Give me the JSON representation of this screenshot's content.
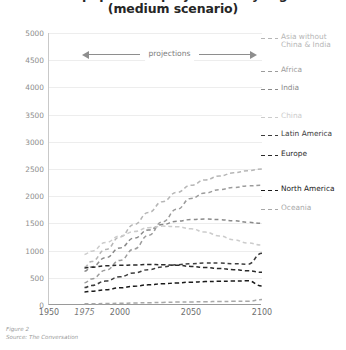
{
  "title": {
    "line1": "World population projections by region",
    "line2": "(medium scenario)"
  },
  "annotation": {
    "projections_label": "projections"
  },
  "footer": {
    "figure": "Figure 2",
    "source": "Source: The Conversation"
  },
  "chart_data": {
    "type": "line",
    "title": "World population projections by region (medium scenario)",
    "xlabel": "",
    "ylabel": "",
    "xlim": [
      1950,
      2100
    ],
    "ylim": [
      0,
      5000
    ],
    "grid": true,
    "legend_position": "right",
    "xticks": [
      1950,
      1975,
      2000,
      2050,
      2100
    ],
    "xtick_labels": [
      "1950",
      "1975",
      "2000",
      "2050",
      "2100"
    ],
    "yticks": [
      0,
      500,
      1000,
      1500,
      2000,
      2500,
      3000,
      3500,
      4000,
      4500,
      5000
    ],
    "ytick_labels": [
      "0",
      "500",
      "1000",
      "1500",
      "2000",
      "2500",
      "3000",
      "3500",
      "4000",
      "4500",
      "5000"
    ],
    "annotations": [
      {
        "text": "projections",
        "from_x": 1975,
        "to_x": 2100,
        "y": 4750,
        "style": "double-arrow"
      }
    ],
    "x": [
      1975,
      1980,
      1990,
      2000,
      2010,
      2020,
      2030,
      2040,
      2050,
      2060,
      2070,
      2080,
      2090,
      2100
    ],
    "series": [
      {
        "name": "Asia without\nChina & India",
        "label": "Asia without China & India",
        "color": "#b6b6b6",
        "values": [
          700,
          800,
          1020,
          1250,
          1480,
          1700,
          1900,
          2070,
          2200,
          2300,
          2370,
          2430,
          2470,
          2500
        ]
      },
      {
        "name": "Africa",
        "label": "Africa",
        "color": "#9c9c9c",
        "values": [
          410,
          480,
          640,
          820,
          1030,
          1280,
          1530,
          1760,
          1960,
          2060,
          2120,
          2160,
          2190,
          2200
        ]
      },
      {
        "name": "India",
        "label": "India",
        "color": "#8a8a8a",
        "values": [
          620,
          700,
          870,
          1050,
          1230,
          1380,
          1480,
          1540,
          1570,
          1580,
          1570,
          1550,
          1520,
          1500
        ]
      },
      {
        "name": "China",
        "label": "China",
        "color": "#cccccc",
        "values": [
          930,
          990,
          1150,
          1270,
          1350,
          1420,
          1450,
          1440,
          1400,
          1340,
          1270,
          1200,
          1140,
          1100
        ]
      },
      {
        "name": "Latin America",
        "label": "Latin America",
        "color": "#3d3d3d",
        "values": [
          320,
          360,
          440,
          520,
          590,
          650,
          700,
          740,
          760,
          770,
          770,
          760,
          750,
          950
        ]
      },
      {
        "name": "Europe",
        "label": "Europe",
        "color": "#2a2a2a",
        "values": [
          680,
          695,
          720,
          730,
          735,
          745,
          740,
          730,
          710,
          690,
          670,
          650,
          630,
          600
        ]
      },
      {
        "name": "North America",
        "label": "North America",
        "color": "#1a1a1a",
        "values": [
          240,
          255,
          280,
          315,
          345,
          370,
          390,
          405,
          420,
          430,
          435,
          440,
          445,
          350
        ]
      },
      {
        "name": "Oceania",
        "label": "Oceania",
        "color": "#a8a8a8",
        "values": [
          21,
          23,
          27,
          31,
          37,
          43,
          48,
          53,
          57,
          61,
          64,
          67,
          69,
          100
        ]
      }
    ],
    "legend_entries": [
      {
        "label": "Asia without\nChina & India",
        "color": "#b6b6b6",
        "value_2100": 2500
      },
      {
        "label": "Africa",
        "color": "#9c9c9c",
        "value_2100": 2200
      },
      {
        "label": "India",
        "color": "#8a8a8a",
        "value_2100": 1500
      },
      {
        "label": "China",
        "color": "#cccccc",
        "value_2100": 1100
      },
      {
        "label": "Latin America",
        "color": "#3d3d3d",
        "value_2100": 950
      },
      {
        "label": "Europe",
        "color": "#2a2a2a",
        "value_2100": 600
      },
      {
        "label": "North America",
        "color": "#1a1a1a",
        "value_2100": 350
      },
      {
        "label": "Oceania",
        "color": "#a8a8a8",
        "value_2100": 100
      }
    ]
  }
}
